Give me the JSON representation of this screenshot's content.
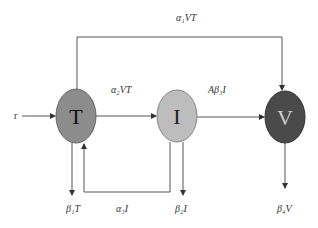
{
  "diagram": {
    "nodes": [
      {
        "id": "T",
        "label": "T",
        "fill": "#8c8c8c",
        "text_color": "#111111"
      },
      {
        "id": "I",
        "label": "I",
        "fill": "#bdbdbd",
        "text_color": "#222222"
      },
      {
        "id": "V",
        "label": "V",
        "fill": "#4a4a4a",
        "text_color": "#cccccc"
      }
    ],
    "edges": {
      "input_r": "r",
      "T_to_V_top": "α₁VT",
      "T_to_I": "α₂VT",
      "I_to_V": "Aβ₃I",
      "T_death": "β₁T",
      "I_to_T_feedback": "α₃I",
      "I_death": "β₂I",
      "V_death": "β₄V"
    },
    "line_color": "#555555"
  }
}
